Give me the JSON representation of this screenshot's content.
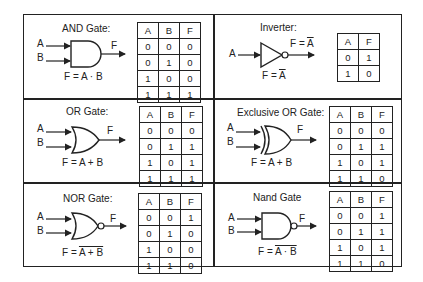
{
  "gates": [
    {
      "id": "and",
      "title": "AND Gate:",
      "equation": "F = A · B",
      "equation_overline": "",
      "inputs": [
        "A",
        "B"
      ],
      "output": "F",
      "headers": [
        "A",
        "B",
        "F"
      ],
      "rows": [
        [
          "0",
          "0",
          "0"
        ],
        [
          "0",
          "1",
          "0"
        ],
        [
          "1",
          "0",
          "0"
        ],
        [
          "1",
          "1",
          "1"
        ]
      ]
    },
    {
      "id": "inverter",
      "title": "Inverter:",
      "equation_prefix": "F = ",
      "equation_overline": "A",
      "output_label_prefix": "F = ",
      "output_label_overline": "A",
      "inputs": [
        "A"
      ],
      "headers": [
        "A",
        "F"
      ],
      "rows": [
        [
          "0",
          "1"
        ],
        [
          "1",
          "0"
        ]
      ]
    },
    {
      "id": "or",
      "title": "OR Gate:",
      "equation": "F = A + B",
      "inputs": [
        "A",
        "B"
      ],
      "output": "F",
      "headers": [
        "A",
        "B",
        "F"
      ],
      "rows": [
        [
          "0",
          "0",
          "0"
        ],
        [
          "0",
          "1",
          "1"
        ],
        [
          "1",
          "0",
          "1"
        ],
        [
          "1",
          "1",
          "1"
        ]
      ]
    },
    {
      "id": "xor",
      "title": "Exclusive OR Gate:",
      "equation": "F = A + B",
      "inputs": [
        "A",
        "B"
      ],
      "output": "F",
      "headers": [
        "A",
        "B",
        "F"
      ],
      "rows": [
        [
          "0",
          "0",
          "0"
        ],
        [
          "0",
          "1",
          "1"
        ],
        [
          "1",
          "0",
          "1"
        ],
        [
          "1",
          "1",
          "0"
        ]
      ]
    },
    {
      "id": "nor",
      "title": "NOR Gate:",
      "equation_prefix": "F = ",
      "equation_overline": "A + B",
      "inputs": [
        "A",
        "B"
      ],
      "output": "F",
      "headers": [
        "A",
        "B",
        "F"
      ],
      "rows": [
        [
          "0",
          "0",
          "1"
        ],
        [
          "0",
          "1",
          "0"
        ],
        [
          "1",
          "0",
          "0"
        ],
        [
          "1",
          "1",
          "0"
        ]
      ]
    },
    {
      "id": "nand",
      "title": "Nand Gate",
      "equation_prefix": "F = ",
      "equation_overline": "A · B",
      "inputs": [
        "A",
        "B"
      ],
      "output": "F",
      "headers": [
        "A",
        "B",
        "F"
      ],
      "rows": [
        [
          "0",
          "0",
          "1"
        ],
        [
          "0",
          "1",
          "1"
        ],
        [
          "1",
          "0",
          "1"
        ],
        [
          "1",
          "1",
          "0"
        ]
      ]
    }
  ]
}
